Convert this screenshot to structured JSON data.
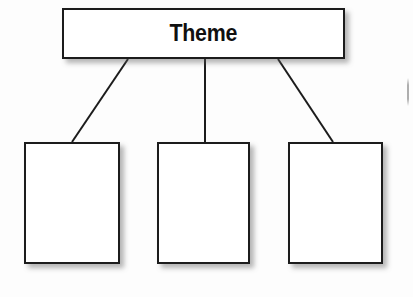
{
  "diagram": {
    "type": "hierarchy-tree",
    "title": "",
    "background_color": "#fdfdfd",
    "stroke_color": "#1c1c1c",
    "fill_color": "#ffffff",
    "root": {
      "label": "Theme",
      "shape": "rectangle",
      "x": 62,
      "y": 8,
      "width": 283,
      "height": 51,
      "text_color": "#101010",
      "bold": true
    },
    "children": [
      {
        "label": "",
        "shape": "rectangle",
        "x": 24,
        "y": 142,
        "width": 96,
        "height": 122
      },
      {
        "label": "",
        "shape": "rectangle",
        "x": 157,
        "y": 142,
        "width": 93,
        "height": 122
      },
      {
        "label": "",
        "shape": "rectangle",
        "x": 288,
        "y": 142,
        "width": 95,
        "height": 122
      }
    ],
    "connectors": [
      {
        "name": "root-to-child-1",
        "x1": 128,
        "y1": 59,
        "x2": 72,
        "y2": 142
      },
      {
        "name": "root-to-child-2",
        "x1": 205,
        "y1": 59,
        "x2": 205,
        "y2": 142
      },
      {
        "name": "root-to-child-3",
        "x1": 278,
        "y1": 59,
        "x2": 333,
        "y2": 142
      }
    ]
  }
}
